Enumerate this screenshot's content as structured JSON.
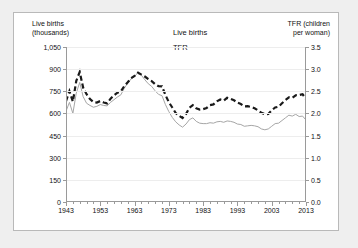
{
  "chart_data": {
    "type": "line",
    "title": "",
    "xlabel": "",
    "ylabel": "Live births (thousands)",
    "y2label": "TFR (children per woman)",
    "xlim": [
      1943,
      2013
    ],
    "ylim": [
      0,
      1050
    ],
    "y2lim": [
      0.0,
      3.5
    ],
    "grid": true,
    "legend_position": "top-center",
    "y_ticks": [
      "0",
      "150",
      "300",
      "450",
      "600",
      "750",
      "900",
      "1,050"
    ],
    "y_tick_values": [
      0,
      150,
      300,
      450,
      600,
      750,
      900,
      1050
    ],
    "y2_ticks": [
      "0.0",
      "0.5",
      "1.0",
      "1.5",
      "2.0",
      "2.5",
      "3.0",
      "3.5"
    ],
    "y2_tick_values": [
      0.0,
      0.5,
      1.0,
      1.5,
      2.0,
      2.5,
      3.0,
      3.5
    ],
    "x_ticks": [
      "1943",
      "1953",
      "1963",
      "1973",
      "1983",
      "1993",
      "2003",
      "2013"
    ],
    "x_tick_values": [
      1943,
      1953,
      1963,
      1973,
      1983,
      1993,
      2003,
      2013
    ],
    "x": [
      1943,
      1944,
      1945,
      1946,
      1947,
      1948,
      1949,
      1950,
      1951,
      1952,
      1953,
      1954,
      1955,
      1956,
      1957,
      1958,
      1959,
      1960,
      1961,
      1962,
      1963,
      1964,
      1965,
      1966,
      1967,
      1968,
      1969,
      1970,
      1971,
      1972,
      1973,
      1974,
      1975,
      1976,
      1977,
      1978,
      1979,
      1980,
      1981,
      1982,
      1983,
      1984,
      1985,
      1986,
      1987,
      1988,
      1989,
      1990,
      1991,
      1992,
      1993,
      1994,
      1995,
      1996,
      1997,
      1998,
      1999,
      2000,
      2001,
      2002,
      2003,
      2004,
      2005,
      2006,
      2007,
      2008,
      2009,
      2010,
      2011,
      2012,
      2013
    ],
    "series": [
      {
        "name": "Live births",
        "axis": "left",
        "units": "thousands",
        "style": "dashed",
        "color": "#1a1a1a",
        "values": [
          684,
          751,
          680,
          821,
          881,
          775,
          730,
          697,
          677,
          674,
          684,
          674,
          668,
          700,
          723,
          741,
          749,
          785,
          811,
          839,
          854,
          876,
          863,
          850,
          832,
          819,
          798,
          784,
          783,
          725,
          676,
          640,
          603,
          584,
          569,
          596,
          638,
          656,
          635,
          626,
          629,
          637,
          656,
          661,
          682,
          694,
          687,
          706,
          699,
          689,
          673,
          664,
          648,
          649,
          643,
          635,
          621,
          604,
          595,
          596,
          621,
          640,
          646,
          669,
          690,
          709,
          706,
          723,
          724,
          730,
          698
        ]
      },
      {
        "name": "TFR",
        "axis": "right",
        "units": "children per woman",
        "style": "solid",
        "color": "#a6a6a6",
        "values": [
          2.05,
          2.25,
          2.0,
          2.46,
          2.7,
          2.38,
          2.23,
          2.18,
          2.14,
          2.16,
          2.2,
          2.18,
          2.17,
          2.25,
          2.31,
          2.37,
          2.42,
          2.57,
          2.68,
          2.78,
          2.83,
          2.93,
          2.86,
          2.76,
          2.67,
          2.61,
          2.51,
          2.43,
          2.4,
          2.2,
          2.04,
          1.91,
          1.81,
          1.74,
          1.69,
          1.76,
          1.86,
          1.9,
          1.82,
          1.78,
          1.77,
          1.77,
          1.79,
          1.78,
          1.81,
          1.82,
          1.8,
          1.83,
          1.82,
          1.8,
          1.76,
          1.75,
          1.71,
          1.72,
          1.73,
          1.72,
          1.7,
          1.65,
          1.63,
          1.65,
          1.71,
          1.77,
          1.78,
          1.84,
          1.9,
          1.96,
          1.94,
          1.98,
          1.93,
          1.94,
          1.85
        ]
      }
    ]
  },
  "axis_titles": {
    "left": "Live births\n(thousands)",
    "right": "TFR (children\nper woman)"
  },
  "legend": {
    "items": [
      {
        "label": "Live births",
        "key": "dashed-line-key"
      },
      {
        "label": "TFR",
        "key": "solid-line-key"
      }
    ]
  },
  "colors": {
    "live_births": "#1a1a1a",
    "tfr": "#a6a6a6",
    "grid": "#ededed",
    "axis": "#9a9a9a",
    "background": "#efefef",
    "plot_background": "#ffffff"
  }
}
